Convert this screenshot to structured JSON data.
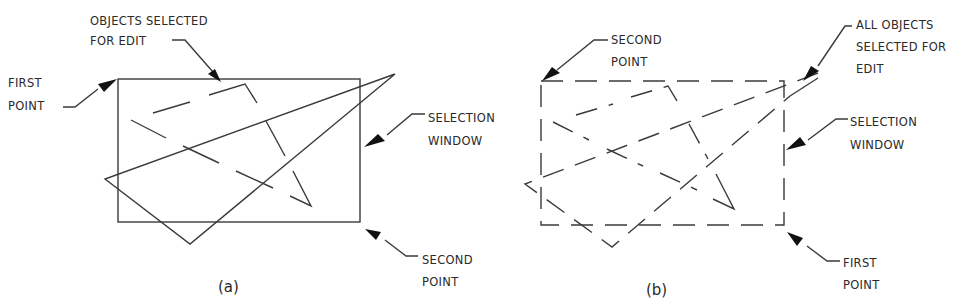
{
  "figure_a": {
    "caption": "(a)",
    "labels": {
      "objects_selected_line1": "OBJECTS SELECTED",
      "objects_selected_line2": "FOR EDIT",
      "first_point_line1": "FIRST",
      "first_point_line2": "POINT",
      "selection_window_line1": "SELECTION",
      "selection_window_line2": "WINDOW",
      "second_point_line1": "SECOND",
      "second_point_line2": "POINT"
    },
    "window_style": "solid"
  },
  "figure_b": {
    "caption": "(b)",
    "labels": {
      "second_point_line1": "SECOND",
      "second_point_line2": "POINT",
      "all_objects_line1": "ALL OBJECTS",
      "all_objects_line2": "SELECTED FOR",
      "all_objects_line3": "EDIT",
      "selection_window_line1": "SELECTION",
      "selection_window_line2": "WINDOW",
      "first_point_line1": "FIRST",
      "first_point_line2": "POINT"
    },
    "window_style": "dashed"
  }
}
